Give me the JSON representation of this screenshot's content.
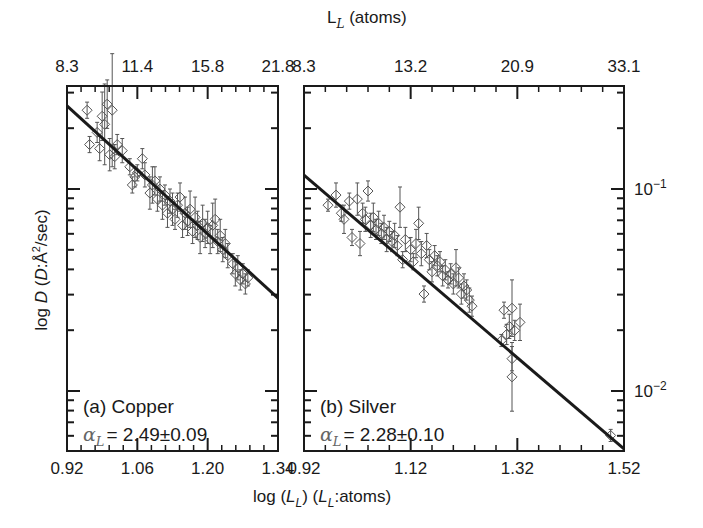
{
  "chart_data": [
    {
      "type": "scatter",
      "panel": "a",
      "title": "(a) Copper",
      "annotation": "αL = 2.49±0.09",
      "xlabel": "log (L_L) (L_L:atoms)",
      "ylabel": "log D (D:Å²/sec)",
      "top_xlabel": "L_L (atoms)",
      "xlim": [
        0.92,
        1.34
      ],
      "ylim_log10": [
        -2.28,
        -0.48
      ],
      "x_ticks": [
        0.92,
        1.06,
        1.2,
        1.34
      ],
      "x_tick_labels": [
        "0.92",
        "1.06",
        "1.20",
        "1.34"
      ],
      "top_tick_labels": [
        "8.3",
        "11.4",
        "15.8",
        "21.8"
      ],
      "error_bars": true,
      "marker": "open-diamond",
      "fit_line": {
        "x": [
          0.92,
          1.34
        ],
        "log10_y": [
          -0.589,
          -1.54
        ]
      },
      "points": [
        {
          "x": 0.96,
          "logy": -0.61,
          "err": 0.04
        },
        {
          "x": 0.965,
          "logy": -0.78,
          "err": 0.04
        },
        {
          "x": 0.98,
          "logy": -0.72,
          "err": 0.05
        },
        {
          "x": 0.985,
          "logy": -0.8,
          "err": 0.06
        },
        {
          "x": 0.99,
          "logy": -0.64,
          "err": 0.12
        },
        {
          "x": 0.995,
          "logy": -0.68,
          "err": 0.2
        },
        {
          "x": 1.0,
          "logy": -0.58,
          "err": 0.12
        },
        {
          "x": 1.005,
          "logy": -0.83,
          "err": 0.08
        },
        {
          "x": 1.01,
          "logy": -0.61,
          "err": 0.28
        },
        {
          "x": 1.015,
          "logy": -0.84,
          "err": 0.06
        },
        {
          "x": 1.02,
          "logy": -0.78,
          "err": 0.05
        },
        {
          "x": 1.03,
          "logy": -0.81,
          "err": 0.06
        },
        {
          "x": 1.045,
          "logy": -0.89,
          "err": 0.04
        },
        {
          "x": 1.05,
          "logy": -0.98,
          "err": 0.04
        },
        {
          "x": 1.055,
          "logy": -0.94,
          "err": 0.05
        },
        {
          "x": 1.06,
          "logy": -0.92,
          "err": 0.04
        },
        {
          "x": 1.07,
          "logy": -0.85,
          "err": 0.05
        },
        {
          "x": 1.075,
          "logy": -0.93,
          "err": 0.06
        },
        {
          "x": 1.085,
          "logy": -1.02,
          "err": 0.08
        },
        {
          "x": 1.09,
          "logy": -0.98,
          "err": 0.09
        },
        {
          "x": 1.095,
          "logy": -0.96,
          "err": 0.07
        },
        {
          "x": 1.1,
          "logy": -1.05,
          "err": 0.06
        },
        {
          "x": 1.105,
          "logy": -1.0,
          "err": 0.06
        },
        {
          "x": 1.11,
          "logy": -1.08,
          "err": 0.07
        },
        {
          "x": 1.115,
          "logy": -1.03,
          "err": 0.05
        },
        {
          "x": 1.12,
          "logy": -1.12,
          "err": 0.07
        },
        {
          "x": 1.125,
          "logy": -1.06,
          "err": 0.06
        },
        {
          "x": 1.13,
          "logy": -1.1,
          "err": 0.08
        },
        {
          "x": 1.135,
          "logy": -1.15,
          "err": 0.05
        },
        {
          "x": 1.14,
          "logy": -1.08,
          "err": 0.06
        },
        {
          "x": 1.145,
          "logy": -1.04,
          "err": 0.07
        },
        {
          "x": 1.15,
          "logy": -1.18,
          "err": 0.06
        },
        {
          "x": 1.155,
          "logy": -1.12,
          "err": 0.08
        },
        {
          "x": 1.16,
          "logy": -1.16,
          "err": 0.07
        },
        {
          "x": 1.165,
          "logy": -1.1,
          "err": 0.09
        },
        {
          "x": 1.17,
          "logy": -1.21,
          "err": 0.06
        },
        {
          "x": 1.175,
          "logy": -1.14,
          "err": 0.1
        },
        {
          "x": 1.18,
          "logy": -1.18,
          "err": 0.07
        },
        {
          "x": 1.185,
          "logy": -1.24,
          "err": 0.08
        },
        {
          "x": 1.19,
          "logy": -1.17,
          "err": 0.09
        },
        {
          "x": 1.195,
          "logy": -1.22,
          "err": 0.07
        },
        {
          "x": 1.2,
          "logy": -1.19,
          "err": 0.08
        },
        {
          "x": 1.205,
          "logy": -1.25,
          "err": 0.07
        },
        {
          "x": 1.21,
          "logy": -1.18,
          "err": 0.11
        },
        {
          "x": 1.215,
          "logy": -1.15,
          "err": 0.1
        },
        {
          "x": 1.22,
          "logy": -1.26,
          "err": 0.06
        },
        {
          "x": 1.225,
          "logy": -1.23,
          "err": 0.08
        },
        {
          "x": 1.23,
          "logy": -1.3,
          "err": 0.06
        },
        {
          "x": 1.235,
          "logy": -1.27,
          "err": 0.07
        },
        {
          "x": 1.24,
          "logy": -1.33,
          "err": 0.06
        },
        {
          "x": 1.25,
          "logy": -1.37,
          "err": 0.05
        },
        {
          "x": 1.255,
          "logy": -1.42,
          "err": 0.06
        },
        {
          "x": 1.26,
          "logy": -1.39,
          "err": 0.06
        },
        {
          "x": 1.265,
          "logy": -1.45,
          "err": 0.05
        },
        {
          "x": 1.27,
          "logy": -1.42,
          "err": 0.05
        },
        {
          "x": 1.275,
          "logy": -1.47,
          "err": 0.05
        },
        {
          "x": 1.28,
          "logy": -1.44,
          "err": 0.04
        }
      ]
    },
    {
      "type": "scatter",
      "panel": "b",
      "title": "(b) Silver",
      "annotation": "αL = 2.28±0.10",
      "xlabel": "log (L_L) (L_L:atoms)",
      "ylabel": "log D (D:Å²/sec)",
      "top_xlabel": "L_L (atoms)",
      "xlim": [
        0.92,
        1.52
      ],
      "ylim_log10": [
        -2.28,
        -0.48
      ],
      "x_ticks": [
        0.92,
        1.12,
        1.32,
        1.52
      ],
      "x_tick_labels": [
        "0.92",
        "1.12",
        "1.32",
        "1.52"
      ],
      "top_tick_labels": [
        "8.3",
        "13.2",
        "20.9",
        "33.1"
      ],
      "right_y_ticks": [
        -1,
        -2
      ],
      "right_y_tick_labels": [
        "10",
        "10"
      ],
      "right_y_tick_sups": [
        "−1",
        "−2"
      ],
      "error_bars": true,
      "marker": "open-diamond",
      "fit_line": {
        "x": [
          0.92,
          1.52
        ],
        "log10_y": [
          -0.931,
          -2.287
        ]
      },
      "points": [
        {
          "x": 0.965,
          "logy": -1.08,
          "err": 0.03
        },
        {
          "x": 0.98,
          "logy": -1.03,
          "err": 0.06
        },
        {
          "x": 0.99,
          "logy": -1.12,
          "err": 0.04
        },
        {
          "x": 0.995,
          "logy": -1.15,
          "err": 0.07
        },
        {
          "x": 1.005,
          "logy": -1.06,
          "err": 0.04
        },
        {
          "x": 1.01,
          "logy": -1.24,
          "err": 0.04
        },
        {
          "x": 1.02,
          "logy": -1.05,
          "err": 0.08
        },
        {
          "x": 1.025,
          "logy": -1.27,
          "err": 0.06
        },
        {
          "x": 1.03,
          "logy": -1.12,
          "err": 0.05
        },
        {
          "x": 1.035,
          "logy": -1.15,
          "err": 0.06
        },
        {
          "x": 1.04,
          "logy": -1.01,
          "err": 0.05
        },
        {
          "x": 1.045,
          "logy": -1.18,
          "err": 0.06
        },
        {
          "x": 1.05,
          "logy": -1.14,
          "err": 0.07
        },
        {
          "x": 1.055,
          "logy": -1.2,
          "err": 0.05
        },
        {
          "x": 1.06,
          "logy": -1.17,
          "err": 0.06
        },
        {
          "x": 1.065,
          "logy": -1.22,
          "err": 0.05
        },
        {
          "x": 1.07,
          "logy": -1.19,
          "err": 0.06
        },
        {
          "x": 1.075,
          "logy": -1.25,
          "err": 0.06
        },
        {
          "x": 1.08,
          "logy": -1.21,
          "err": 0.05
        },
        {
          "x": 1.085,
          "logy": -1.26,
          "err": 0.05
        },
        {
          "x": 1.09,
          "logy": -1.23,
          "err": 0.06
        },
        {
          "x": 1.095,
          "logy": -1.28,
          "err": 0.05
        },
        {
          "x": 1.1,
          "logy": -1.09,
          "err": 0.1
        },
        {
          "x": 1.105,
          "logy": -1.35,
          "err": 0.04
        },
        {
          "x": 1.11,
          "logy": -1.25,
          "err": 0.06
        },
        {
          "x": 1.12,
          "logy": -1.3,
          "err": 0.06
        },
        {
          "x": 1.125,
          "logy": -1.36,
          "err": 0.04
        },
        {
          "x": 1.13,
          "logy": -1.27,
          "err": 0.07
        },
        {
          "x": 1.135,
          "logy": -1.17,
          "err": 0.08
        },
        {
          "x": 1.14,
          "logy": -1.32,
          "err": 0.06
        },
        {
          "x": 1.145,
          "logy": -1.52,
          "err": 0.04
        },
        {
          "x": 1.15,
          "logy": -1.28,
          "err": 0.06
        },
        {
          "x": 1.155,
          "logy": -1.35,
          "err": 0.05
        },
        {
          "x": 1.16,
          "logy": -1.41,
          "err": 0.05
        },
        {
          "x": 1.165,
          "logy": -1.33,
          "err": 0.05
        },
        {
          "x": 1.17,
          "logy": -1.38,
          "err": 0.05
        },
        {
          "x": 1.175,
          "logy": -1.36,
          "err": 0.05
        },
        {
          "x": 1.18,
          "logy": -1.43,
          "err": 0.05
        },
        {
          "x": 1.185,
          "logy": -1.4,
          "err": 0.05
        },
        {
          "x": 1.19,
          "logy": -1.45,
          "err": 0.04
        },
        {
          "x": 1.195,
          "logy": -1.42,
          "err": 0.05
        },
        {
          "x": 1.2,
          "logy": -1.47,
          "err": 0.05
        },
        {
          "x": 1.205,
          "logy": -1.39,
          "err": 0.09
        },
        {
          "x": 1.21,
          "logy": -1.44,
          "err": 0.05
        },
        {
          "x": 1.215,
          "logy": -1.52,
          "err": 0.05
        },
        {
          "x": 1.22,
          "logy": -1.48,
          "err": 0.06
        },
        {
          "x": 1.225,
          "logy": -1.5,
          "err": 0.05
        },
        {
          "x": 1.23,
          "logy": -1.55,
          "err": 0.06
        },
        {
          "x": 1.235,
          "logy": -1.58,
          "err": 0.05
        },
        {
          "x": 1.295,
          "logy": -1.6,
          "err": 0.04
        },
        {
          "x": 1.29,
          "logy": -1.75,
          "err": 0.03
        },
        {
          "x": 1.3,
          "logy": -1.72,
          "err": 0.05
        },
        {
          "x": 1.305,
          "logy": -1.68,
          "err": 0.06
        },
        {
          "x": 1.31,
          "logy": -1.59,
          "err": 0.14
        },
        {
          "x": 1.31,
          "logy": -1.84,
          "err": 0.06
        },
        {
          "x": 1.31,
          "logy": -1.93,
          "err": 0.17
        },
        {
          "x": 1.315,
          "logy": -1.7,
          "err": 0.05
        },
        {
          "x": 1.325,
          "logy": -1.66,
          "err": 0.09
        },
        {
          "x": 1.495,
          "logy": -2.22,
          "err": 0.03
        }
      ]
    }
  ],
  "figure": {
    "top_axis_title": "L",
    "top_axis_title_sub": "L",
    "top_axis_title_suffix": " (atoms)",
    "bottom_axis_title_pre": "log (",
    "bottom_axis_title_L": "L",
    "bottom_axis_title_sub": "L",
    "bottom_axis_title_mid": ") (",
    "bottom_axis_title_L2": "L",
    "bottom_axis_title_sub2": "L",
    "bottom_axis_title_suffix": ":atoms)",
    "left_axis_title_pre": "log ",
    "left_axis_title_D": "D",
    "left_axis_title_mid": " (",
    "left_axis_title_D2": "D",
    "left_axis_title_suffix": ":Å",
    "left_axis_title_sup": "2",
    "left_axis_title_end": "/sec)",
    "panel_a": {
      "label": "(a) Copper",
      "alpha_symbol": "α",
      "alpha_sub": "L",
      "alpha_value": "= 2.49±0.09"
    },
    "panel_b": {
      "label": "(b) Silver",
      "alpha_symbol": "α",
      "alpha_sub": "L",
      "alpha_value": "= 2.28±0.10"
    },
    "colors": {
      "ink": "#1a1a1a",
      "marker": "#555555",
      "background": "#ffffff"
    }
  }
}
